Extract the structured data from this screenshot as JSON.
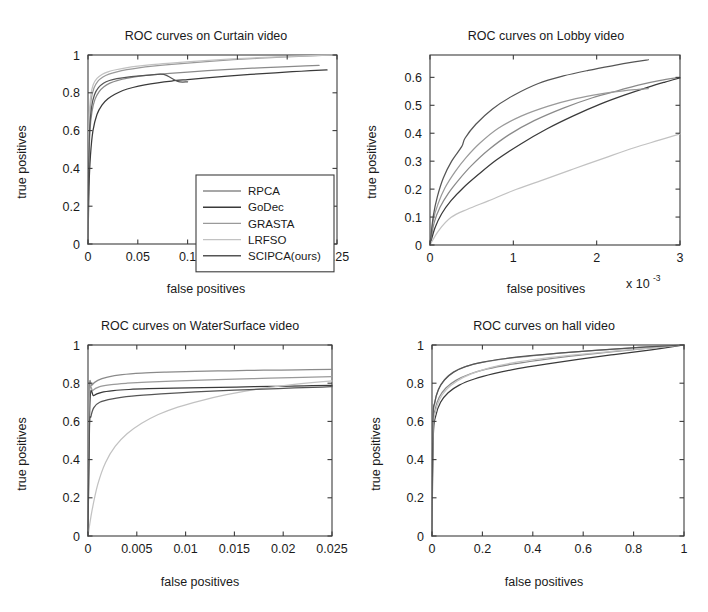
{
  "figure": {
    "background": "#ffffff",
    "layout": "2x2 grid of ROC curve subplots"
  },
  "series_style": [
    {
      "name": "RPCA",
      "color": "#8a8a8a",
      "width": 1.2
    },
    {
      "name": "GoDec",
      "color": "#3a3a3a",
      "width": 1.4
    },
    {
      "name": "GRASTA",
      "color": "#9a9a9a",
      "width": 1.2
    },
    {
      "name": "LRFSO",
      "color": "#c2c2c2",
      "width": 1.2
    },
    {
      "name": "SCIPCA(ours)",
      "color": "#555555",
      "width": 1.3
    }
  ],
  "legend": {
    "panel": "curtain",
    "entries": [
      "RPCA",
      "GoDec",
      "GRASTA",
      "LRFSO",
      "SCIPCA(ours)"
    ]
  },
  "chart_data": [
    {
      "id": "curtain",
      "type": "line",
      "title": "ROC curves on Curtain video",
      "xlabel": "false positives",
      "ylabel": "true positives",
      "xlim": [
        0,
        0.25
      ],
      "ylim": [
        0,
        1
      ],
      "xticks": [
        0,
        0.05,
        0.1,
        0.15,
        0.2,
        0.25
      ],
      "xticklabels": [
        "0",
        "0.05",
        "0.1",
        "0.15",
        "0.2",
        "0.25"
      ],
      "yticks": [
        0,
        0.2,
        0.4,
        0.6,
        0.8,
        1
      ],
      "yticklabels": [
        "0",
        "0.2",
        "0.4",
        "0.6",
        "0.8",
        "1"
      ],
      "grid": false,
      "legend_position": "lower right",
      "series": [
        {
          "name": "RPCA",
          "x": [
            0,
            0.0008,
            0.002,
            0.004,
            0.007,
            0.011,
            0.016,
            0.022,
            0.03,
            0.04,
            0.052,
            0.066,
            0.082,
            0.1,
            0.12,
            0.142,
            0.165,
            0.19,
            0.213,
            0.232
          ],
          "y": [
            0,
            0.4,
            0.6,
            0.7,
            0.765,
            0.805,
            0.832,
            0.851,
            0.866,
            0.878,
            0.888,
            0.896,
            0.903,
            0.909,
            0.917,
            0.924,
            0.93,
            0.936,
            0.941,
            0.945
          ]
        },
        {
          "name": "GoDec",
          "x": [
            0,
            0.001,
            0.0025,
            0.005,
            0.009,
            0.014,
            0.02,
            0.027,
            0.035,
            0.045,
            0.057,
            0.07,
            0.084,
            0.1,
            0.119,
            0.14,
            0.163,
            0.188,
            0.214,
            0.24
          ],
          "y": [
            0,
            0.3,
            0.47,
            0.6,
            0.685,
            0.735,
            0.768,
            0.792,
            0.812,
            0.828,
            0.842,
            0.853,
            0.862,
            0.87,
            0.879,
            0.888,
            0.897,
            0.906,
            0.914,
            0.921
          ]
        },
        {
          "name": "GRASTA",
          "x": [
            0,
            0.0006,
            0.0016,
            0.0032,
            0.006,
            0.01,
            0.015,
            0.021,
            0.029,
            0.039,
            0.051,
            0.065,
            0.081,
            0.1,
            0.122,
            0.146,
            0.172,
            0.199,
            0.224,
            0.245
          ],
          "y": [
            0,
            0.45,
            0.66,
            0.765,
            0.825,
            0.862,
            0.884,
            0.899,
            0.911,
            0.922,
            0.932,
            0.941,
            0.949,
            0.957,
            0.966,
            0.975,
            0.983,
            0.99,
            0.996,
            1.0
          ]
        },
        {
          "name": "LRFSO",
          "x": [
            0,
            0.0005,
            0.0014,
            0.0028,
            0.0052,
            0.009,
            0.014,
            0.02,
            0.028,
            0.038,
            0.05,
            0.064,
            0.08,
            0.099,
            0.121,
            0.145,
            0.171,
            0.198,
            0.224,
            0.246
          ],
          "y": [
            0,
            0.47,
            0.68,
            0.785,
            0.843,
            0.876,
            0.897,
            0.911,
            0.922,
            0.932,
            0.941,
            0.949,
            0.956,
            0.963,
            0.971,
            0.979,
            0.986,
            0.992,
            0.997,
            1.0
          ]
        },
        {
          "name": "SCIPCA(ours)",
          "x": [
            0,
            0.0007,
            0.0018,
            0.0036,
            0.0065,
            0.0105,
            0.0155,
            0.0215,
            0.029,
            0.038,
            0.049,
            0.062,
            0.076,
            0.09,
            0.1
          ],
          "y": [
            0,
            0.42,
            0.62,
            0.725,
            0.79,
            0.827,
            0.85,
            0.865,
            0.875,
            0.882,
            0.888,
            0.893,
            0.897,
            0.86,
            0.858
          ]
        }
      ]
    },
    {
      "id": "lobby",
      "type": "line",
      "title": "ROC curves on Lobby video",
      "xlabel": "false positives",
      "ylabel": "true positives",
      "x_exponent_label": "x 10",
      "x_exponent_power": "-3",
      "xlim": [
        0,
        0.003
      ],
      "ylim": [
        0,
        0.68
      ],
      "xticks": [
        0,
        0.001,
        0.002,
        0.003
      ],
      "xticklabels": [
        "0",
        "1",
        "2",
        "3"
      ],
      "yticks": [
        0,
        0.1,
        0.2,
        0.3,
        0.4,
        0.5,
        0.6
      ],
      "yticklabels": [
        "0",
        "0.1",
        "0.2",
        "0.3",
        "0.4",
        "0.5",
        "0.6"
      ],
      "grid": false,
      "legend_position": "none",
      "series": [
        {
          "name": "RPCA",
          "x": [
            0,
            5e-05,
            0.00012,
            0.00022,
            0.00035,
            0.0005,
            0.0007,
            0.00095,
            0.00125,
            0.0016,
            0.00195,
            0.00225,
            0.0025,
            0.00275,
            0.003
          ],
          "y": [
            0,
            0.08,
            0.135,
            0.185,
            0.235,
            0.285,
            0.34,
            0.395,
            0.445,
            0.49,
            0.527,
            0.552,
            0.572,
            0.588,
            0.6
          ]
        },
        {
          "name": "GoDec",
          "x": [
            0,
            6e-05,
            0.00014,
            0.00025,
            0.0004,
            0.00058,
            0.0008,
            0.00108,
            0.0014,
            0.00172,
            0.00205,
            0.00235,
            0.00262,
            0.00282,
            0.003
          ],
          "y": [
            0,
            0.062,
            0.112,
            0.158,
            0.205,
            0.252,
            0.305,
            0.36,
            0.415,
            0.462,
            0.505,
            0.538,
            0.565,
            0.583,
            0.598
          ]
        },
        {
          "name": "GRASTA",
          "x": [
            0,
            4e-05,
            0.0001,
            0.00018,
            0.0003,
            0.00043,
            0.0006,
            0.00082,
            0.0011,
            0.00142,
            0.00175,
            0.00205,
            0.00232,
            0.0025,
            0.00262
          ],
          "y": [
            0,
            0.09,
            0.15,
            0.205,
            0.262,
            0.312,
            0.365,
            0.418,
            0.462,
            0.497,
            0.524,
            0.541,
            0.552,
            0.557,
            0.56
          ]
        },
        {
          "name": "LRFSO",
          "x": [
            0,
            0.0001,
            0.00025,
            0.00045,
            0.0007,
            0.001,
            0.00135,
            0.00172,
            0.0021,
            0.00245,
            0.00275,
            0.003
          ],
          "y": [
            0,
            0.05,
            0.098,
            0.128,
            0.158,
            0.195,
            0.232,
            0.272,
            0.312,
            0.348,
            0.375,
            0.398
          ]
        },
        {
          "name": "SCIPCA(ours)",
          "x": [
            0,
            4e-05,
            9e-05,
            0.00016,
            0.00026,
            0.00038,
            0.00042,
            0.00055,
            0.00075,
            0.001,
            0.0013,
            0.0016,
            0.0019,
            0.0022,
            0.00245,
            0.00262
          ],
          "y": [
            0,
            0.105,
            0.175,
            0.24,
            0.3,
            0.352,
            0.382,
            0.432,
            0.487,
            0.535,
            0.578,
            0.605,
            0.625,
            0.642,
            0.655,
            0.663
          ]
        }
      ]
    },
    {
      "id": "watersurface",
      "type": "line",
      "title": "ROC curves on WaterSurface video",
      "xlabel": "false positives",
      "ylabel": "true positives",
      "xlim": [
        0,
        0.025
      ],
      "ylim": [
        0,
        1
      ],
      "xticks": [
        0,
        0.005,
        0.01,
        0.015,
        0.02,
        0.025
      ],
      "xticklabels": [
        "0",
        "0.005",
        "0.01",
        "0.015",
        "0.02",
        "0.025"
      ],
      "yticks": [
        0,
        0.2,
        0.4,
        0.6,
        0.8,
        1
      ],
      "yticklabels": [
        "0",
        "0.2",
        "0.4",
        "0.6",
        "0.8",
        "1"
      ],
      "grid": false,
      "legend_position": "none",
      "series": [
        {
          "name": "RPCA",
          "x": [
            0,
            0.00012,
            0.0004,
            0.001,
            0.002,
            0.0035,
            0.0055,
            0.008,
            0.011,
            0.0145,
            0.018,
            0.0215,
            0.025
          ],
          "y": [
            0,
            0.745,
            0.79,
            0.815,
            0.832,
            0.845,
            0.853,
            0.858,
            0.862,
            0.865,
            0.868,
            0.87,
            0.872
          ]
        },
        {
          "name": "GoDec",
          "x": [
            0,
            0.0002,
            0.0006,
            0.0014,
            0.0026,
            0.0042,
            0.0062,
            0.0088,
            0.0118,
            0.0152,
            0.0188,
            0.0222,
            0.025
          ],
          "y": [
            0,
            0.7,
            0.735,
            0.752,
            0.761,
            0.767,
            0.771,
            0.774,
            0.777,
            0.78,
            0.783,
            0.786,
            0.789
          ]
        },
        {
          "name": "GRASTA",
          "x": [
            0,
            0.00014,
            0.0005,
            0.0012,
            0.0024,
            0.004,
            0.006,
            0.0086,
            0.0116,
            0.015,
            0.0186,
            0.022,
            0.025
          ],
          "y": [
            0,
            0.72,
            0.762,
            0.782,
            0.793,
            0.8,
            0.806,
            0.811,
            0.816,
            0.821,
            0.826,
            0.83,
            0.834
          ]
        },
        {
          "name": "LRFSO",
          "x": [
            0,
            0.0004,
            0.001,
            0.0018,
            0.0028,
            0.004,
            0.0055,
            0.0072,
            0.0092,
            0.0115,
            0.0142,
            0.0172,
            0.0205,
            0.0235,
            0.025
          ],
          "y": [
            0,
            0.13,
            0.27,
            0.385,
            0.47,
            0.535,
            0.59,
            0.636,
            0.675,
            0.708,
            0.74,
            0.768,
            0.79,
            0.806,
            0.812
          ]
        },
        {
          "name": "SCIPCA(ours)",
          "x": [
            0,
            0.00015,
            0.0003,
            0.0006,
            0.0012,
            0.0025,
            0.0045,
            0.0075,
            0.011,
            0.015,
            0.0195,
            0.024,
            0.025
          ],
          "y": [
            0,
            0.56,
            0.625,
            0.672,
            0.7,
            0.718,
            0.732,
            0.744,
            0.755,
            0.764,
            0.772,
            0.78,
            0.782
          ]
        }
      ]
    },
    {
      "id": "hall",
      "type": "line",
      "title": "ROC curves on hall video",
      "xlabel": "false positives",
      "ylabel": "true positives",
      "xlim": [
        0,
        1
      ],
      "ylim": [
        0,
        1
      ],
      "xticks": [
        0,
        0.2,
        0.4,
        0.6,
        0.8,
        1
      ],
      "xticklabels": [
        "0",
        "0.2",
        "0.4",
        "0.6",
        "0.8",
        "1"
      ],
      "yticks": [
        0,
        0.2,
        0.4,
        0.6,
        0.8,
        1
      ],
      "yticklabels": [
        "0",
        "0.2",
        "0.4",
        "0.6",
        "0.8",
        "1"
      ],
      "grid": false,
      "legend_position": "none",
      "series": [
        {
          "name": "RPCA",
          "x": [
            0,
            0.004,
            0.012,
            0.028,
            0.055,
            0.095,
            0.15,
            0.22,
            0.31,
            0.42,
            0.55,
            0.7,
            0.86,
            1.0
          ],
          "y": [
            0,
            0.56,
            0.66,
            0.725,
            0.775,
            0.815,
            0.848,
            0.875,
            0.898,
            0.92,
            0.942,
            0.963,
            0.983,
            1.0
          ]
        },
        {
          "name": "GoDec",
          "x": [
            0,
            0.005,
            0.015,
            0.034,
            0.064,
            0.108,
            0.168,
            0.245,
            0.34,
            0.452,
            0.58,
            0.722,
            0.87,
            1.0
          ],
          "y": [
            0,
            0.52,
            0.63,
            0.7,
            0.75,
            0.79,
            0.822,
            0.85,
            0.876,
            0.9,
            0.925,
            0.95,
            0.975,
            1.0
          ]
        },
        {
          "name": "GRASTA",
          "x": [
            0,
            0.003,
            0.01,
            0.024,
            0.048,
            0.082,
            0.13,
            0.195,
            0.278,
            0.382,
            0.505,
            0.65,
            0.82,
            1.0
          ],
          "y": [
            0,
            0.58,
            0.69,
            0.762,
            0.815,
            0.856,
            0.886,
            0.908,
            0.926,
            0.941,
            0.957,
            0.972,
            0.987,
            1.0
          ]
        },
        {
          "name": "LRFSO",
          "x": [
            0,
            0.004,
            0.013,
            0.03,
            0.058,
            0.1,
            0.158,
            0.232,
            0.325,
            0.436,
            0.565,
            0.71,
            0.862,
            1.0
          ],
          "y": [
            0,
            0.535,
            0.645,
            0.715,
            0.768,
            0.812,
            0.85,
            0.882,
            0.908,
            0.929,
            0.948,
            0.966,
            0.984,
            1.0
          ]
        },
        {
          "name": "SCIPCA(ours)",
          "x": [
            0,
            0.0035,
            0.011,
            0.026,
            0.05,
            0.086,
            0.136,
            0.202,
            0.286,
            0.39,
            0.515,
            0.66,
            0.825,
            1.0
          ],
          "y": [
            0,
            0.6,
            0.7,
            0.768,
            0.818,
            0.858,
            0.888,
            0.91,
            0.928,
            0.944,
            0.959,
            0.973,
            0.988,
            1.0
          ]
        }
      ]
    }
  ]
}
